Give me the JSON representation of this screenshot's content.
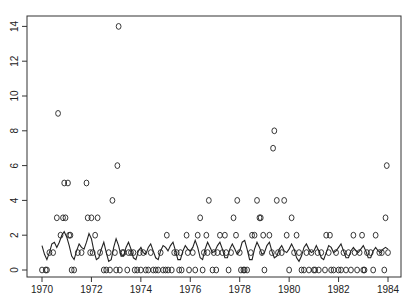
{
  "chart_data": {
    "type": "scatter",
    "title": "",
    "xlabel": "",
    "ylabel": "",
    "xlim": [
      1969.4,
      1984.5
    ],
    "ylim": [
      -0.4,
      14.8
    ],
    "grid": false,
    "legend": null,
    "x_ticks": [
      1970,
      1972,
      1974,
      1976,
      1978,
      1980,
      1982,
      1984
    ],
    "x_tick_labels": [
      "1970",
      "1972",
      "1974",
      "1976",
      "1978",
      "1980",
      "1982",
      "1984"
    ],
    "y_ticks": [
      0,
      2,
      4,
      6,
      8,
      10,
      12,
      14
    ],
    "y_tick_labels": [
      "0",
      "2",
      "4",
      "6",
      "8",
      "10",
      "12",
      "14"
    ],
    "marker": "o",
    "series": [
      {
        "name": "counts",
        "kind": "points",
        "points": [
          [
            1970.0,
            0
          ],
          [
            1970.15,
            0
          ],
          [
            1970.2,
            0
          ],
          [
            1970.3,
            1
          ],
          [
            1970.45,
            1
          ],
          [
            1970.6,
            3
          ],
          [
            1970.65,
            9
          ],
          [
            1970.75,
            2
          ],
          [
            1970.85,
            3
          ],
          [
            1970.9,
            5
          ],
          [
            1970.95,
            3
          ],
          [
            1971.05,
            5
          ],
          [
            1971.1,
            2
          ],
          [
            1971.15,
            2
          ],
          [
            1971.2,
            0
          ],
          [
            1971.3,
            0
          ],
          [
            1971.45,
            1
          ],
          [
            1971.6,
            1
          ],
          [
            1971.8,
            5
          ],
          [
            1971.85,
            3
          ],
          [
            1971.95,
            1
          ],
          [
            1972.0,
            3
          ],
          [
            1972.05,
            1
          ],
          [
            1972.15,
            2
          ],
          [
            1972.25,
            3
          ],
          [
            1972.35,
            1
          ],
          [
            1972.5,
            0
          ],
          [
            1972.6,
            0
          ],
          [
            1972.7,
            1
          ],
          [
            1972.75,
            0
          ],
          [
            1972.85,
            4
          ],
          [
            1972.95,
            1
          ],
          [
            1973.0,
            0
          ],
          [
            1973.05,
            6
          ],
          [
            1973.1,
            14
          ],
          [
            1973.15,
            0
          ],
          [
            1973.25,
            1
          ],
          [
            1973.3,
            1
          ],
          [
            1973.45,
            0
          ],
          [
            1973.5,
            1
          ],
          [
            1973.6,
            1
          ],
          [
            1973.7,
            1
          ],
          [
            1973.75,
            0
          ],
          [
            1973.85,
            0
          ],
          [
            1973.95,
            1
          ],
          [
            1974.0,
            0
          ],
          [
            1974.1,
            1
          ],
          [
            1974.2,
            0
          ],
          [
            1974.3,
            0
          ],
          [
            1974.4,
            1
          ],
          [
            1974.5,
            0
          ],
          [
            1974.6,
            0
          ],
          [
            1974.7,
            0
          ],
          [
            1974.8,
            1
          ],
          [
            1974.9,
            0
          ],
          [
            1975.0,
            0
          ],
          [
            1975.05,
            2
          ],
          [
            1975.1,
            0
          ],
          [
            1975.25,
            0
          ],
          [
            1975.35,
            1
          ],
          [
            1975.45,
            1
          ],
          [
            1975.55,
            0
          ],
          [
            1975.6,
            1
          ],
          [
            1975.65,
            0
          ],
          [
            1975.85,
            2
          ],
          [
            1975.9,
            1
          ],
          [
            1975.95,
            0
          ],
          [
            1976.1,
            1
          ],
          [
            1976.2,
            0
          ],
          [
            1976.3,
            2
          ],
          [
            1976.4,
            3
          ],
          [
            1976.5,
            0
          ],
          [
            1976.55,
            1
          ],
          [
            1976.65,
            2
          ],
          [
            1976.7,
            1
          ],
          [
            1976.75,
            4
          ],
          [
            1976.9,
            0
          ],
          [
            1976.95,
            1
          ],
          [
            1977.05,
            0
          ],
          [
            1977.1,
            1
          ],
          [
            1977.2,
            2
          ],
          [
            1977.3,
            1
          ],
          [
            1977.4,
            2
          ],
          [
            1977.45,
            1
          ],
          [
            1977.55,
            0
          ],
          [
            1977.65,
            1
          ],
          [
            1977.75,
            3
          ],
          [
            1977.85,
            2
          ],
          [
            1977.9,
            4
          ],
          [
            1978.0,
            1
          ],
          [
            1978.05,
            0
          ],
          [
            1978.15,
            0
          ],
          [
            1978.2,
            0
          ],
          [
            1978.3,
            0
          ],
          [
            1978.45,
            1
          ],
          [
            1978.5,
            2
          ],
          [
            1978.6,
            2
          ],
          [
            1978.7,
            4
          ],
          [
            1978.8,
            3
          ],
          [
            1978.85,
            3
          ],
          [
            1978.9,
            1
          ],
          [
            1978.95,
            2
          ],
          [
            1979.0,
            0
          ],
          [
            1979.2,
            2
          ],
          [
            1979.3,
            1
          ],
          [
            1979.35,
            7
          ],
          [
            1979.4,
            8
          ],
          [
            1979.5,
            4
          ],
          [
            1979.55,
            1
          ],
          [
            1979.7,
            1
          ],
          [
            1979.8,
            4
          ],
          [
            1979.9,
            2
          ],
          [
            1980.0,
            0
          ],
          [
            1980.1,
            3
          ],
          [
            1980.2,
            1
          ],
          [
            1980.3,
            2
          ],
          [
            1980.4,
            1
          ],
          [
            1980.5,
            0
          ],
          [
            1980.6,
            0
          ],
          [
            1980.7,
            1
          ],
          [
            1980.8,
            0
          ],
          [
            1980.9,
            1
          ],
          [
            1981.0,
            0
          ],
          [
            1981.05,
            0
          ],
          [
            1981.15,
            1
          ],
          [
            1981.2,
            0
          ],
          [
            1981.3,
            1
          ],
          [
            1981.45,
            0
          ],
          [
            1981.5,
            2
          ],
          [
            1981.6,
            1
          ],
          [
            1981.65,
            2
          ],
          [
            1981.7,
            0
          ],
          [
            1981.8,
            0
          ],
          [
            1981.9,
            1
          ],
          [
            1982.0,
            0
          ],
          [
            1982.1,
            0
          ],
          [
            1982.2,
            1
          ],
          [
            1982.3,
            0
          ],
          [
            1982.4,
            1
          ],
          [
            1982.5,
            0
          ],
          [
            1982.6,
            2
          ],
          [
            1982.65,
            1
          ],
          [
            1982.75,
            0
          ],
          [
            1982.85,
            1
          ],
          [
            1982.95,
            2
          ],
          [
            1983.0,
            0
          ],
          [
            1983.05,
            0
          ],
          [
            1983.15,
            1
          ],
          [
            1983.3,
            1
          ],
          [
            1983.4,
            0
          ],
          [
            1983.5,
            2
          ],
          [
            1983.65,
            1
          ],
          [
            1983.75,
            1
          ],
          [
            1983.85,
            0
          ],
          [
            1983.9,
            3
          ],
          [
            1983.95,
            6
          ],
          [
            1984.0,
            1
          ]
        ]
      },
      {
        "name": "smooth",
        "kind": "line",
        "x": [
          1970.0,
          1970.1,
          1970.2,
          1970.3,
          1970.4,
          1970.5,
          1970.6,
          1970.7,
          1970.8,
          1970.9,
          1971.0,
          1971.1,
          1971.2,
          1971.3,
          1971.4,
          1971.5,
          1971.6,
          1971.7,
          1971.8,
          1971.9,
          1972.0,
          1972.1,
          1972.2,
          1972.3,
          1972.4,
          1972.5,
          1972.6,
          1972.7,
          1972.8,
          1972.9,
          1973.0,
          1973.1,
          1973.2,
          1973.3,
          1973.4,
          1973.5,
          1973.6,
          1973.7,
          1973.8,
          1973.9,
          1974.0,
          1974.1,
          1974.2,
          1974.3,
          1974.4,
          1974.5,
          1974.6,
          1974.7,
          1974.8,
          1974.9,
          1975.0,
          1975.1,
          1975.2,
          1975.3,
          1975.4,
          1975.5,
          1975.6,
          1975.7,
          1975.8,
          1975.9,
          1976.0,
          1976.1,
          1976.2,
          1976.3,
          1976.4,
          1976.5,
          1976.6,
          1976.7,
          1976.8,
          1976.9,
          1977.0,
          1977.1,
          1977.2,
          1977.3,
          1977.4,
          1977.5,
          1977.6,
          1977.7,
          1977.8,
          1977.9,
          1978.0,
          1978.1,
          1978.2,
          1978.3,
          1978.4,
          1978.5,
          1978.6,
          1978.7,
          1978.8,
          1978.9,
          1979.0,
          1979.1,
          1979.2,
          1979.3,
          1979.4,
          1979.5,
          1979.6,
          1979.7,
          1979.8,
          1979.9,
          1980.0,
          1980.1,
          1980.2,
          1980.3,
          1980.4,
          1980.5,
          1980.6,
          1980.7,
          1980.8,
          1980.9,
          1981.0,
          1981.1,
          1981.2,
          1981.3,
          1981.4,
          1981.5,
          1981.6,
          1981.7,
          1981.8,
          1981.9,
          1982.0,
          1982.1,
          1982.2,
          1982.3,
          1982.4,
          1982.5,
          1982.6,
          1982.7,
          1982.8,
          1982.9,
          1983.0,
          1983.1,
          1983.2,
          1983.3,
          1983.4,
          1983.5,
          1983.6,
          1983.7,
          1983.8,
          1983.9,
          1984.0
        ],
        "y": [
          1.4,
          0.9,
          0.6,
          1.0,
          1.5,
          1.6,
          1.3,
          1.6,
          2.0,
          2.2,
          1.9,
          1.4,
          0.8,
          0.6,
          1.1,
          1.5,
          1.3,
          1.2,
          1.6,
          2.1,
          1.8,
          1.1,
          0.6,
          0.7,
          1.2,
          1.6,
          1.0,
          0.5,
          0.6,
          1.3,
          1.8,
          1.4,
          0.8,
          0.8,
          1.3,
          1.6,
          1.2,
          0.7,
          0.6,
          1.1,
          1.3,
          1.0,
          0.9,
          1.3,
          1.5,
          1.1,
          0.7,
          0.6,
          1.1,
          1.4,
          1.3,
          1.1,
          1.4,
          1.6,
          1.1,
          0.6,
          0.6,
          1.1,
          1.4,
          1.2,
          1.1,
          1.3,
          1.7,
          1.3,
          0.7,
          0.6,
          1.2,
          1.6,
          1.3,
          1.0,
          1.1,
          1.4,
          1.6,
          1.2,
          0.7,
          0.7,
          1.2,
          1.5,
          1.2,
          0.9,
          1.1,
          1.6,
          1.7,
          1.2,
          0.6,
          0.6,
          1.2,
          1.6,
          1.3,
          0.9,
          1.0,
          1.4,
          1.6,
          1.1,
          0.7,
          0.8,
          1.2,
          1.4,
          1.1,
          1.0,
          1.2,
          1.5,
          1.2,
          0.7,
          0.5,
          0.8,
          1.3,
          1.5,
          1.2,
          1.0,
          1.1,
          1.4,
          1.1,
          0.7,
          0.6,
          1.0,
          1.4,
          1.3,
          1.0,
          1.1,
          1.3,
          1.5,
          1.1,
          0.7,
          0.7,
          1.1,
          1.3,
          1.1,
          1.0,
          1.2,
          1.4,
          1.1,
          0.7,
          0.7,
          1.1,
          1.3,
          1.1,
          1.0,
          1.2,
          1.3,
          1.2
        ]
      }
    ]
  }
}
